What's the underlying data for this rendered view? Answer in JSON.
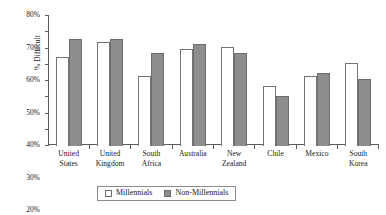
{
  "chart_data": {
    "type": "bar",
    "title": "",
    "xlabel": "",
    "ylabel": "% Difficult",
    "ylim": [
      0,
      80
    ],
    "ytick_labels": [
      "0%",
      "10%",
      "20%",
      "30%",
      "40%",
      "50%",
      "60%",
      "70%",
      "80%"
    ],
    "ytick_values": [
      0,
      10,
      20,
      30,
      40,
      50,
      60,
      70,
      80
    ],
    "grid": false,
    "legend_position": "bottom-center",
    "categories": [
      "United States",
      "United Kingdom",
      "South Africa",
      "Australia",
      "New Zealand",
      "Chile",
      "Mexico",
      "South Korea"
    ],
    "category_lines": [
      [
        "United",
        "States"
      ],
      [
        "United",
        "Kingdom"
      ],
      [
        "South",
        "Africa"
      ],
      [
        "Australia",
        ""
      ],
      [
        "New",
        "Zealand"
      ],
      [
        "Chile",
        ""
      ],
      [
        "Mexico",
        ""
      ],
      [
        "South",
        "Korea"
      ]
    ],
    "series": [
      {
        "name": "Millennials",
        "color": "#ffffff",
        "values": [
          55,
          64,
          43,
          60,
          61,
          37,
          43,
          51
        ]
      },
      {
        "name": "Non-Millennials",
        "color": "#8d8d8d",
        "values": [
          66,
          66,
          57,
          63,
          57,
          31,
          45,
          41
        ]
      }
    ]
  },
  "legend": {
    "items": [
      {
        "label": "Millennials",
        "swatch": "open-square-swatch"
      },
      {
        "label": "Non-Millennials",
        "swatch": "filled-square-swatch"
      }
    ]
  }
}
